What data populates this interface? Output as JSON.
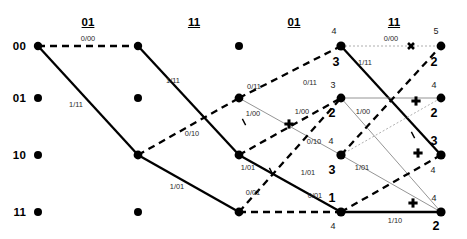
{
  "diagram": {
    "width": 467,
    "height": 239,
    "colors": {
      "ink": "#000000",
      "label": "#2b2b2b",
      "thin": "#7a7a7a",
      "dotted": "#9a9a9a"
    }
  },
  "row_labels": [
    {
      "text": "00",
      "x": 26,
      "y": 46
    },
    {
      "text": "01",
      "x": 26,
      "y": 98
    },
    {
      "text": "10",
      "x": 26,
      "y": 155
    },
    {
      "text": "11",
      "x": 26,
      "y": 212
    }
  ],
  "column_headers": [
    {
      "text": "01",
      "x": 88,
      "y": 22
    },
    {
      "text": "11",
      "x": 194,
      "y": 22
    },
    {
      "text": "01",
      "x": 294,
      "y": 22
    },
    {
      "text": "11",
      "x": 394,
      "y": 22
    }
  ],
  "nodes": [
    {
      "id": "c0r0",
      "x": 38,
      "y": 46,
      "r": 4.2
    },
    {
      "id": "c0r1",
      "x": 38,
      "y": 98,
      "r": 4.0
    },
    {
      "id": "c0r2",
      "x": 38,
      "y": 155,
      "r": 4.0
    },
    {
      "id": "c0r3",
      "x": 38,
      "y": 212,
      "r": 4.0
    },
    {
      "id": "c1r0",
      "x": 138,
      "y": 46,
      "r": 4.2
    },
    {
      "id": "c1r1",
      "x": 138,
      "y": 98,
      "r": 4.0
    },
    {
      "id": "c1r2",
      "x": 138,
      "y": 155,
      "r": 4.4
    },
    {
      "id": "c1r3",
      "x": 138,
      "y": 212,
      "r": 4.0
    },
    {
      "id": "c2r0",
      "x": 239,
      "y": 46,
      "r": 4.0
    },
    {
      "id": "c2r1",
      "x": 239,
      "y": 98,
      "r": 4.4
    },
    {
      "id": "c2r2",
      "x": 239,
      "y": 155,
      "r": 4.4
    },
    {
      "id": "c2r3",
      "x": 239,
      "y": 212,
      "r": 4.4
    },
    {
      "id": "c3r0",
      "x": 341,
      "y": 46,
      "r": 4.6
    },
    {
      "id": "c3r1",
      "x": 341,
      "y": 98,
      "r": 4.4
    },
    {
      "id": "c3r2",
      "x": 341,
      "y": 155,
      "r": 4.6
    },
    {
      "id": "c3r3",
      "x": 341,
      "y": 212,
      "r": 4.6
    },
    {
      "id": "c4r0",
      "x": 441,
      "y": 46,
      "r": 4.4
    },
    {
      "id": "c4r1",
      "x": 441,
      "y": 98,
      "r": 4.4
    },
    {
      "id": "c4r2",
      "x": 441,
      "y": 155,
      "r": 4.6
    },
    {
      "id": "c4r3",
      "x": 441,
      "y": 212,
      "r": 4.6
    }
  ],
  "edges": [
    {
      "from": "c0r0",
      "to": "c1r0",
      "style": "dashed-bold"
    },
    {
      "from": "c0r0",
      "to": "c1r2",
      "style": "solid-bold"
    },
    {
      "from": "c1r0",
      "to": "c2r2",
      "style": "solid-bold"
    },
    {
      "from": "c1r2",
      "to": "c2r1",
      "style": "dashed-bold"
    },
    {
      "from": "c1r2",
      "to": "c2r3",
      "style": "solid-bold"
    },
    {
      "from": "c2r1",
      "to": "c3r0",
      "style": "dashed-bold"
    },
    {
      "from": "c2r1",
      "to": "c3r2",
      "style": "thin"
    },
    {
      "from": "c2r2",
      "to": "c3r1",
      "style": "dashed-bold"
    },
    {
      "from": "c2r2",
      "to": "c3r3",
      "style": "solid-bold"
    },
    {
      "from": "c2r3",
      "to": "c3r1",
      "style": "dashed-bold"
    },
    {
      "from": "c3r0",
      "to": "c4r0",
      "style": "dotted-thin"
    },
    {
      "from": "c3r0",
      "to": "c4r2",
      "style": "solid-bold"
    },
    {
      "from": "c3r1",
      "to": "c4r1",
      "style": "thin"
    },
    {
      "from": "c3r1",
      "to": "c4r3",
      "style": "thin"
    },
    {
      "from": "c3r2",
      "to": "c4r1",
      "style": "dotted-thin"
    },
    {
      "from": "c3r2",
      "to": "c4r3",
      "style": "thin"
    },
    {
      "from": "c3r3",
      "to": "c4r2",
      "style": "dashed-bold"
    },
    {
      "from": "c3r3",
      "to": "c4r3",
      "style": "solid-bold"
    },
    {
      "from": "c2r3",
      "to": "c3r3",
      "style": "dashed-bold"
    },
    {
      "from": "c3r2",
      "to": "c4r0",
      "style": "dashed-bold"
    }
  ],
  "edge_labels": [
    {
      "text": "0/00",
      "x": 88,
      "y": 38
    },
    {
      "text": "1/11",
      "x": 76,
      "y": 104
    },
    {
      "text": "1/11",
      "x": 173,
      "y": 80
    },
    {
      "text": "0/10",
      "x": 192,
      "y": 133
    },
    {
      "text": "1/01",
      "x": 177,
      "y": 186
    },
    {
      "text": "0/11",
      "x": 254,
      "y": 86
    },
    {
      "text": "1/00",
      "x": 253,
      "y": 113
    },
    {
      "text": "1/01",
      "x": 248,
      "y": 167
    },
    {
      "text": "0/01",
      "x": 253,
      "y": 192
    },
    {
      "text": "0/11",
      "x": 310,
      "y": 82
    },
    {
      "text": "1/00",
      "x": 302,
      "y": 111
    },
    {
      "text": "0/10",
      "x": 314,
      "y": 141
    },
    {
      "text": "1/01",
      "x": 308,
      "y": 172
    },
    {
      "text": "0/01",
      "x": 315,
      "y": 195
    },
    {
      "text": "0/00",
      "x": 391,
      "y": 38
    },
    {
      "text": "1/11",
      "x": 365,
      "y": 62
    },
    {
      "text": "1/00",
      "x": 363,
      "y": 111
    },
    {
      "text": "1/01",
      "x": 362,
      "y": 167
    },
    {
      "text": "1/10",
      "x": 395,
      "y": 220
    }
  ],
  "metrics": [
    {
      "text": "4",
      "x": 334,
      "y": 31,
      "size": "small"
    },
    {
      "text": "3",
      "x": 336,
      "y": 62,
      "size": "big"
    },
    {
      "text": "3",
      "x": 333,
      "y": 85,
      "size": "small"
    },
    {
      "text": "2",
      "x": 332,
      "y": 113,
      "size": "big"
    },
    {
      "text": "4",
      "x": 331,
      "y": 141,
      "size": "small"
    },
    {
      "text": "3",
      "x": 332,
      "y": 170,
      "size": "big"
    },
    {
      "text": "1",
      "x": 332,
      "y": 198,
      "size": "big"
    },
    {
      "text": "4",
      "x": 333,
      "y": 226,
      "size": "small"
    },
    {
      "text": "5",
      "x": 436,
      "y": 31,
      "size": "small"
    },
    {
      "text": "2",
      "x": 434,
      "y": 62,
      "size": "big"
    },
    {
      "text": "4",
      "x": 434,
      "y": 85,
      "size": "small"
    },
    {
      "text": "2",
      "x": 434,
      "y": 113,
      "size": "big"
    },
    {
      "text": "3",
      "x": 434,
      "y": 141,
      "size": "big"
    },
    {
      "text": "4",
      "x": 433,
      "y": 170,
      "size": "small"
    },
    {
      "text": "4",
      "x": 434,
      "y": 198,
      "size": "small"
    },
    {
      "text": "2",
      "x": 436,
      "y": 226,
      "size": "big"
    }
  ],
  "markers": [
    {
      "kind": "plus",
      "x": 289,
      "y": 124
    },
    {
      "kind": "plus",
      "x": 416,
      "y": 101
    },
    {
      "kind": "plus",
      "x": 418,
      "y": 153
    },
    {
      "kind": "plus",
      "x": 413,
      "y": 203
    },
    {
      "kind": "cross",
      "x": 411,
      "y": 46
    }
  ],
  "hash_marks": [
    {
      "x": 244,
      "y": 122,
      "angle": 62
    },
    {
      "x": 271,
      "y": 171,
      "angle": 62
    },
    {
      "x": 413,
      "y": 135,
      "angle": 62
    }
  ]
}
